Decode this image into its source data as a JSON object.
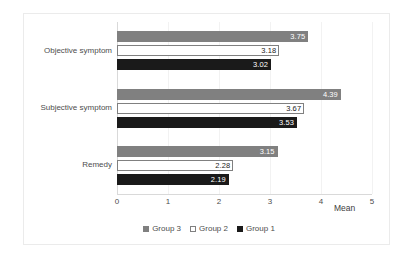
{
  "chart_data": {
    "type": "bar",
    "orientation": "horizontal",
    "title": "",
    "xlabel": "Mean",
    "ylabel": "",
    "xlim": [
      0,
      5
    ],
    "xticks": [
      0,
      1,
      2,
      3,
      4,
      5
    ],
    "xtick_labels": [
      "0",
      "1",
      "2",
      "3",
      "4",
      "5"
    ],
    "grid": true,
    "legend_position": "bottom",
    "categories": [
      "Objective symptom",
      "Subjective symptom",
      "Remedy"
    ],
    "series": [
      {
        "name": "Group 3",
        "color": "#808080",
        "label_color": "#ffffff",
        "values": [
          3.75,
          4.39,
          3.15
        ],
        "value_labels": [
          "3.75",
          "4.39",
          "3.15"
        ]
      },
      {
        "name": "Group 2",
        "color": "#ffffff",
        "label_color": "#1a1a1a",
        "values": [
          3.18,
          3.67,
          2.28
        ],
        "value_labels": [
          "3.18",
          "3.67",
          "2.28"
        ]
      },
      {
        "name": "Group 1",
        "color": "#1a1a1a",
        "label_color": "#ffffff",
        "values": [
          3.02,
          3.53,
          2.19
        ],
        "value_labels": [
          "3.02",
          "3.53",
          "2.19"
        ]
      }
    ]
  },
  "axis": {
    "x_title": "Mean",
    "ticks": [
      "0",
      "1",
      "2",
      "3",
      "4",
      "5"
    ]
  },
  "categories": {
    "labels": [
      "Objective symptom",
      "Subjective symptom",
      "Remedy"
    ]
  },
  "legend": {
    "items": [
      {
        "label": "Group 3",
        "swatch": "gray-square-icon"
      },
      {
        "label": "Group 2",
        "swatch": "white-square-icon"
      },
      {
        "label": "Group 1",
        "swatch": "black-square-icon"
      }
    ]
  },
  "colors": {
    "series_group3": "#808080",
    "series_group2": "#ffffff",
    "series_group1": "#1a1a1a",
    "grid": "#f2f2f2",
    "axis": "#d9d9d9",
    "frame": "#ebebeb",
    "text": "#4d4d4d"
  }
}
